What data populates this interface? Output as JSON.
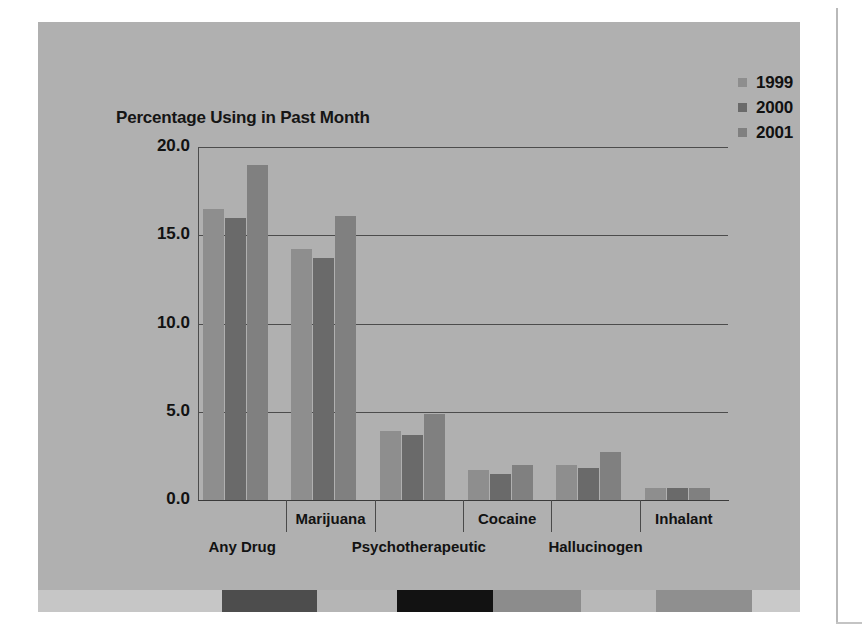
{
  "figure": {
    "background_color": "#b0b0b0",
    "plot_background_color": "#b5b5b5"
  },
  "chart_data": {
    "type": "bar",
    "title": "Percentage Using in Past Month",
    "xlabel": "",
    "ylabel": "Percentage Using in Past Month",
    "categories": [
      "Any Drug",
      "Marijuana",
      "Psychotherapeutic",
      "Cocaine",
      "Hallucinogen",
      "Inhalant"
    ],
    "series": [
      {
        "name": "1999",
        "color": "#8e8e8e",
        "values": [
          16.5,
          14.2,
          3.9,
          1.7,
          2.0,
          0.7
        ]
      },
      {
        "name": "2000",
        "color": "#6a6a6a",
        "values": [
          16.0,
          13.7,
          3.7,
          1.5,
          1.8,
          0.7
        ]
      },
      {
        "name": "2001",
        "color": "#808080",
        "values": [
          19.0,
          16.1,
          4.9,
          2.0,
          2.7,
          0.7
        ]
      }
    ],
    "yticks": [
      "0.0",
      "5.0",
      "10.0",
      "15.0",
      "20.0"
    ],
    "ytick_values": [
      0,
      5,
      10,
      15,
      20
    ],
    "ylim": [
      0,
      20
    ],
    "grid": true,
    "legend_position": "top-right",
    "legend_entries": [
      "1999",
      "2000",
      "2001"
    ]
  },
  "legend": {
    "items": [
      {
        "label": "1999",
        "color": "#8e8e8e"
      },
      {
        "label": "2000",
        "color": "#6a6a6a"
      },
      {
        "label": "2001",
        "color": "#808080"
      }
    ]
  },
  "axis": {
    "ticks": [
      {
        "label": "20.0",
        "value": 20
      },
      {
        "label": "15.0",
        "value": 15
      },
      {
        "label": "10.0",
        "value": 10
      },
      {
        "label": "5.0",
        "value": 5
      },
      {
        "label": "0.0",
        "value": 0
      }
    ],
    "category_labels": [
      {
        "label": "Any Drug",
        "row": "lower"
      },
      {
        "label": "Marijuana",
        "row": "upper"
      },
      {
        "label": "Psychotherapeutic",
        "row": "lower"
      },
      {
        "label": "Cocaine",
        "row": "upper"
      },
      {
        "label": "Hallucinogen",
        "row": "lower"
      },
      {
        "label": "Inhalant",
        "row": "upper"
      }
    ]
  },
  "color_strip": {
    "segments": [
      {
        "color": "#c6c6c6",
        "width": 230
      },
      {
        "color": "#4d4d4d",
        "width": 120
      },
      {
        "color": "#b5b5b5",
        "width": 100
      },
      {
        "color": "#121212",
        "width": 120
      },
      {
        "color": "#8c8c8c",
        "width": 110
      },
      {
        "color": "#b8b8b8",
        "width": 95
      },
      {
        "color": "#8f8f8f",
        "width": 120
      },
      {
        "color": "#c9c9c9",
        "width": 60
      }
    ]
  }
}
